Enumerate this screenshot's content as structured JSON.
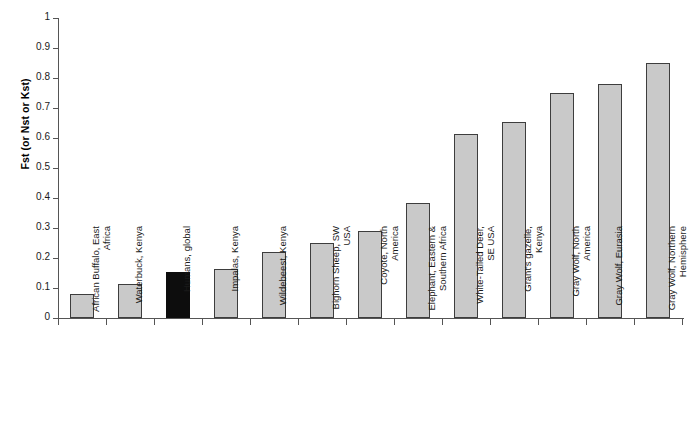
{
  "chart_data": {
    "type": "bar",
    "title": "",
    "subtitle": "",
    "xlabel": "",
    "ylabel": "Fst (or Nst or Kst)",
    "ylim": [
      0,
      1
    ],
    "ytick_labels": [
      "1",
      "0.9",
      "0.8",
      "0.7",
      "0.6",
      "0.5",
      "0.4",
      "0.3",
      "0.2",
      "0.1",
      "0"
    ],
    "ytick_values": [
      1,
      0.9,
      0.8,
      0.7,
      0.6,
      0.5,
      0.4,
      0.3,
      0.2,
      0.1,
      0
    ],
    "grid": false,
    "legend": null,
    "categories": [
      "African Buffalo, East Africa",
      "Waterbuck, Kenya",
      "Humans, global",
      "Impalas, Kenya",
      "Wildebeest, Kenya",
      "Bighorn Sheep, SW USA",
      "Coyote, North America",
      "Elephant, Eastern & Southern Africa",
      "White-Tailed Deer, SE USA",
      "Grant's gazelle, Kenya",
      "Gray Wolf, North America",
      "Gray Wolf, Eurasia",
      "Gray Wolf, Northern Hemisphere"
    ],
    "category_lines": [
      [
        "African Buffalo, East",
        "Africa"
      ],
      [
        "Waterbuck, Kenya"
      ],
      [
        "Humans, global"
      ],
      [
        "Impalas, Kenya"
      ],
      [
        "Wildebeest, Kenya"
      ],
      [
        "Bighorn Sheep, SW",
        "USA"
      ],
      [
        "Coyote, North",
        "America"
      ],
      [
        "Elephant, Eastern &",
        "Southern Africa"
      ],
      [
        "White-Tailed Deer,",
        "SE USA"
      ],
      [
        "Grant's gazelle,",
        "Kenya"
      ],
      [
        "Gray Wolf, North",
        "America"
      ],
      [
        "Gray Wolf, Eurasia"
      ],
      [
        "Gray Wolf, Northern",
        "Hemisphere"
      ]
    ],
    "values": [
      0.08,
      0.113,
      0.153,
      0.165,
      0.22,
      0.25,
      0.29,
      0.385,
      0.615,
      0.655,
      0.75,
      0.78,
      0.85
    ],
    "highlight_index": 2,
    "colors": {
      "bar_fill": "#c9c9c9",
      "bar_border": "#3d3d3d",
      "highlight_fill": "#0d0d0d",
      "axis": "#555555",
      "text": "#1a1a1a",
      "background": "#ffffff"
    }
  }
}
